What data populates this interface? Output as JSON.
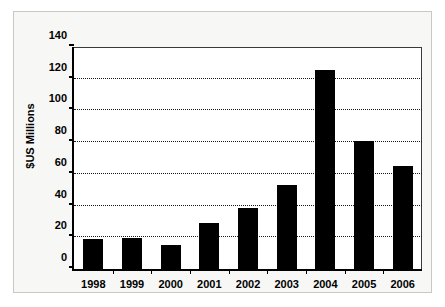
{
  "chart_data": {
    "type": "bar",
    "title": "",
    "xlabel": "",
    "ylabel": "$US Millions",
    "categories": [
      "1998",
      "1999",
      "2000",
      "2001",
      "2002",
      "2003",
      "2004",
      "2005",
      "2006"
    ],
    "values": [
      19,
      19.5,
      15,
      29,
      38.5,
      53,
      125.5,
      81,
      65
    ],
    "ylim": [
      0,
      140
    ],
    "ytick_labels": [
      "0",
      "20",
      "40",
      "60",
      "80",
      "100",
      "120",
      "140"
    ],
    "ytick_values": [
      0,
      20,
      40,
      60,
      80,
      100,
      120,
      140
    ],
    "grid": true,
    "grid_style": "dotted-horizontal",
    "legend": false,
    "bar_color": "#000000",
    "plot_background": "#ffffff",
    "frame_background": "#f7f7f5",
    "axis_color": "#000000"
  }
}
